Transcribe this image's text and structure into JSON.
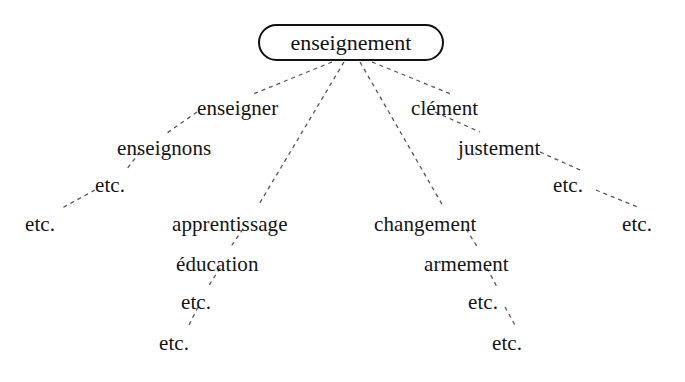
{
  "diagram": {
    "type": "lexical-derivation-tree",
    "root": {
      "label": "enseignement",
      "box": {
        "x": 258,
        "y": 24,
        "width": 186,
        "height": 37
      }
    },
    "branches": [
      {
        "name": "branch-enseigner",
        "nodes": [
          {
            "label": "enseigner",
            "x": 197,
            "y": 98
          },
          {
            "label": "enseignons",
            "x": 117,
            "y": 138
          },
          {
            "label": "etc.",
            "x": 95,
            "y": 175
          },
          {
            "label": "etc.",
            "x": 25,
            "y": 214
          }
        ]
      },
      {
        "name": "branch-apprentissage",
        "nodes": [
          {
            "label": "apprentissage",
            "x": 172,
            "y": 214
          },
          {
            "label": "éducation",
            "x": 176,
            "y": 254
          },
          {
            "label": "etc.",
            "x": 181,
            "y": 292
          },
          {
            "label": "etc.",
            "x": 159,
            "y": 333
          }
        ]
      },
      {
        "name": "branch-changement",
        "nodes": [
          {
            "label": "changement",
            "x": 374,
            "y": 214
          },
          {
            "label": "armement",
            "x": 424,
            "y": 254
          },
          {
            "label": "etc.",
            "x": 468,
            "y": 292
          },
          {
            "label": "etc.",
            "x": 492,
            "y": 333
          }
        ]
      },
      {
        "name": "branch-clement",
        "nodes": [
          {
            "label": "clément",
            "x": 411,
            "y": 98
          },
          {
            "label": "justement",
            "x": 458,
            "y": 138
          },
          {
            "label": "etc.",
            "x": 553,
            "y": 175
          },
          {
            "label": "etc.",
            "x": 622,
            "y": 214
          }
        ]
      }
    ],
    "edges": [
      {
        "name": "edge-root-enseigner",
        "x1": 332,
        "y1": 62,
        "x2": 253,
        "y2": 94
      },
      {
        "name": "edge-root-apprentissage",
        "x1": 344,
        "y1": 62,
        "x2": 258,
        "y2": 206
      },
      {
        "name": "edge-root-changement",
        "x1": 360,
        "y1": 62,
        "x2": 443,
        "y2": 206
      },
      {
        "name": "edge-root-clement",
        "x1": 372,
        "y1": 62,
        "x2": 451,
        "y2": 94
      },
      {
        "name": "edge-enseigner-enseignons",
        "x1": 197,
        "y1": 112,
        "x2": 167,
        "y2": 133
      },
      {
        "name": "edge-enseignons-etc1",
        "x1": 140,
        "y1": 152,
        "x2": 126,
        "y2": 170
      },
      {
        "name": "edge-etc1-etc2",
        "x1": 95,
        "y1": 190,
        "x2": 62,
        "y2": 208
      },
      {
        "name": "edge-apprentissage-education",
        "x1": 243,
        "y1": 229,
        "x2": 230,
        "y2": 248
      },
      {
        "name": "edge-education-etc1",
        "x1": 220,
        "y1": 268,
        "x2": 208,
        "y2": 287
      },
      {
        "name": "edge-etc1-etc2-b",
        "x1": 198,
        "y1": 307,
        "x2": 188,
        "y2": 327
      },
      {
        "name": "edge-changement-armement",
        "x1": 466,
        "y1": 229,
        "x2": 478,
        "y2": 248
      },
      {
        "name": "edge-armement-etc1",
        "x1": 487,
        "y1": 268,
        "x2": 497,
        "y2": 287
      },
      {
        "name": "edge-etc1-etc2-c",
        "x1": 505,
        "y1": 307,
        "x2": 516,
        "y2": 327
      },
      {
        "name": "edge-clement-justement",
        "x1": 435,
        "y1": 112,
        "x2": 480,
        "y2": 132
      },
      {
        "name": "edge-justement-etc1",
        "x1": 540,
        "y1": 152,
        "x2": 580,
        "y2": 170
      },
      {
        "name": "edge-etc1-etc2-d",
        "x1": 596,
        "y1": 190,
        "x2": 640,
        "y2": 208
      }
    ],
    "style": {
      "edge_color": "#555555",
      "edge_dash": "4 4",
      "edge_width": 1.3,
      "node_color": "#141414",
      "root_border_color": "#111111",
      "background": "#ffffff"
    }
  }
}
